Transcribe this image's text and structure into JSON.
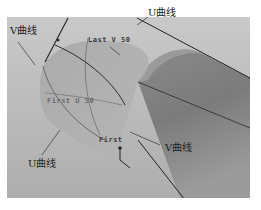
{
  "figure": {
    "colors": {
      "background": "#ffffff",
      "viewport": "#bcbcbc",
      "cylinder": "#8c8c8c",
      "surface_patch": "#a9a9a9",
      "curve_line": "#2b2b2b",
      "label_text": "#222222"
    }
  },
  "labels": {
    "v_curve_top_left": "V曲线",
    "u_curve_top": "U曲线",
    "last_v": "Last V 50",
    "first_u": "First U 50",
    "first": "First",
    "u_curve_bottom_left": "U曲线",
    "v_curve_right": "V曲线"
  }
}
